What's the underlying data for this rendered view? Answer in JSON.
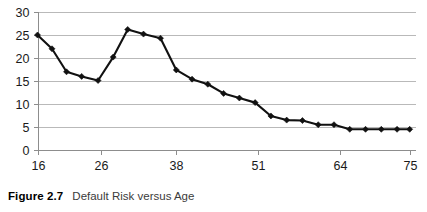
{
  "caption": {
    "label": "Figure 2.7",
    "text": "Default Risk versus Age"
  },
  "chart_data": {
    "type": "line",
    "title": "",
    "xlabel": "",
    "ylabel": "",
    "xlim": [
      16,
      76
    ],
    "ylim": [
      0,
      30
    ],
    "ytick_values": [
      0,
      5,
      10,
      15,
      20,
      25,
      30
    ],
    "ytick_labels": [
      "0",
      "5",
      "10",
      "15",
      "20",
      "25",
      "30"
    ],
    "xtick_values": [
      16,
      26,
      38,
      51,
      64,
      75
    ],
    "xtick_labels": [
      "16",
      "26",
      "38",
      "51",
      "64",
      "75"
    ],
    "grid": "horizontal",
    "legend": "none",
    "marker": "diamond",
    "series": [
      {
        "name": "Default Risk",
        "x": [
          16,
          18,
          20,
          22,
          24,
          26,
          28,
          30,
          32,
          34,
          36,
          38,
          40,
          42,
          44,
          46,
          48,
          50,
          52,
          54,
          56,
          58,
          60,
          62,
          64,
          66
        ],
        "values": [
          25.0,
          22.0,
          17.0,
          16.0,
          15.1,
          15.1,
          20.2,
          26.2,
          25.2,
          24.3,
          17.4,
          15.4,
          14.3,
          12.3,
          11.3,
          10.3,
          7.4,
          6.5,
          6.4,
          5.5,
          5.5,
          4.5,
          4.5,
          4.5,
          4.5,
          4.5
        ]
      }
    ],
    "points": [
      {
        "x": 16,
        "y": 25.0
      },
      {
        "x": 18.3,
        "y": 22.0
      },
      {
        "x": 20.6,
        "y": 17.0
      },
      {
        "x": 23.0,
        "y": 16.0
      },
      {
        "x": 25.6,
        "y": 15.1
      },
      {
        "x": 28.0,
        "y": 20.2
      },
      {
        "x": 30.3,
        "y": 26.2
      },
      {
        "x": 32.8,
        "y": 25.2
      },
      {
        "x": 35.5,
        "y": 24.3
      },
      {
        "x": 38.0,
        "y": 17.4
      },
      {
        "x": 40.5,
        "y": 15.4
      },
      {
        "x": 43.0,
        "y": 14.3
      },
      {
        "x": 45.5,
        "y": 12.3
      },
      {
        "x": 48.0,
        "y": 11.3
      },
      {
        "x": 50.5,
        "y": 10.3
      },
      {
        "x": 53.0,
        "y": 7.4
      },
      {
        "x": 55.5,
        "y": 6.5
      },
      {
        "x": 58.0,
        "y": 6.4
      },
      {
        "x": 60.5,
        "y": 5.5
      },
      {
        "x": 63.0,
        "y": 5.5
      },
      {
        "x": 65.5,
        "y": 4.5
      },
      {
        "x": 68.0,
        "y": 4.5
      },
      {
        "x": 70.5,
        "y": 4.5
      },
      {
        "x": 73.0,
        "y": 4.5
      },
      {
        "x": 75.0,
        "y": 4.5
      }
    ]
  },
  "colors": {
    "series": "#111111",
    "gridline": "#b9b9b9",
    "axis": "#8d8d8d",
    "tick_text": "#1a1a1a",
    "caption_label": "#000000",
    "caption_text": "#3b3b3b",
    "background": "#ffffff"
  }
}
